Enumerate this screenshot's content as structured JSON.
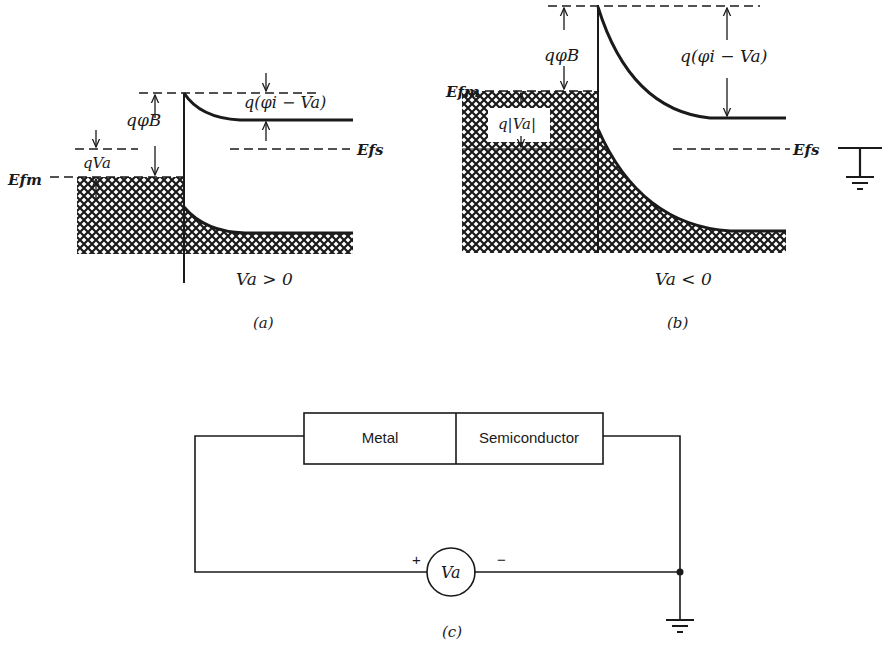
{
  "figure": {
    "panel_a": {
      "caption": "(a)",
      "condition": "Va > 0",
      "labels": {
        "efm": "Efm",
        "efs": "Efs",
        "q_phi_b": "qφB",
        "q_va": "qVa",
        "q_phi_i_minus_va": "q(φi − Va)"
      }
    },
    "panel_b": {
      "caption": "(b)",
      "condition": "Va < 0",
      "labels": {
        "efm": "Efm",
        "efs": "Efs",
        "q_phi_b": "qφB",
        "q_abs_va": "q|Va|",
        "q_phi_i_minus_va": "q(φi − Va)"
      }
    },
    "panel_c": {
      "caption": "(c)",
      "metal_label": "Metal",
      "semiconductor_label": "Semiconductor",
      "source_label": "Va",
      "plus": "+",
      "minus": "−"
    },
    "colors": {
      "ink": "#1a1a1a",
      "background": "#ffffff"
    }
  }
}
